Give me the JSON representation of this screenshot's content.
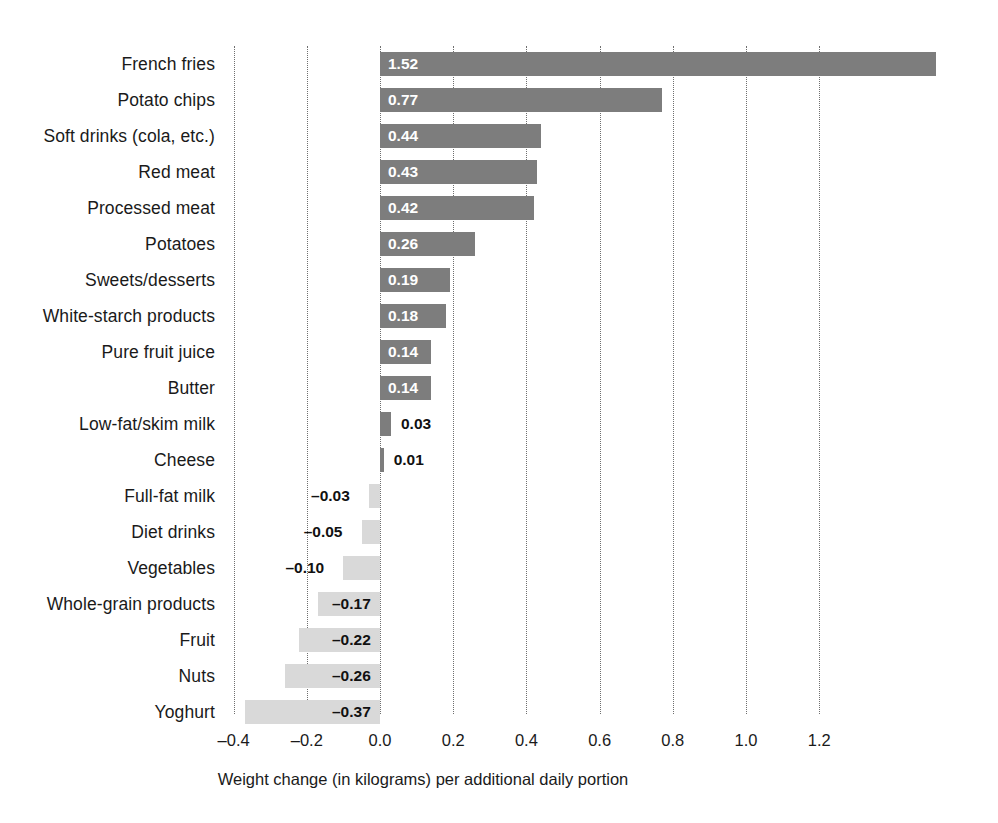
{
  "chart_data": {
    "type": "bar",
    "orientation": "horizontal",
    "title": "",
    "subtitle": "",
    "xlabel": "Weight change (in kilograms) per additional daily portion",
    "ylabel": "",
    "xlim": [
      -0.45,
      1.56
    ],
    "xticks": [
      -0.4,
      -0.2,
      0.0,
      0.2,
      0.4,
      0.6,
      0.8,
      1.0,
      1.2
    ],
    "xticklabels": [
      "–0.4",
      "–0.2",
      "0.0",
      "0.2",
      "0.4",
      "0.6",
      "0.8",
      "1.0",
      "1.2"
    ],
    "grid": "vertical-dotted",
    "legend": "none",
    "colors": {
      "positive_bar": "#7d7d7d",
      "negative_bar": "#d9d9d9",
      "gridline": "#6f6f6f",
      "label_inside": "#ffffff",
      "label_outside": "#111111",
      "background": "#ffffff"
    },
    "categories": [
      "French fries",
      "Potato chips",
      "Soft drinks (cola, etc.)",
      "Red meat",
      "Processed meat",
      "Potatoes",
      "Sweets/desserts",
      "White-starch products",
      "Pure fruit juice",
      "Butter",
      "Low-fat/skim milk",
      "Cheese",
      "Full-fat milk",
      "Diet drinks",
      "Vegetables",
      "Whole-grain products",
      "Fruit",
      "Nuts",
      "Yoghurt"
    ],
    "values": [
      1.52,
      0.77,
      0.44,
      0.43,
      0.42,
      0.26,
      0.19,
      0.18,
      0.14,
      0.14,
      0.03,
      0.01,
      -0.03,
      -0.05,
      -0.1,
      -0.17,
      -0.22,
      -0.26,
      -0.37
    ],
    "value_labels": [
      "1.52",
      "0.77",
      "0.44",
      "0.43",
      "0.42",
      "0.26",
      "0.19",
      "0.18",
      "0.14",
      "0.14",
      "0.03",
      "0.01",
      "–0.03",
      "–0.05",
      "–0.10",
      "–0.17",
      "–0.22",
      "–0.26",
      "–0.37"
    ]
  }
}
